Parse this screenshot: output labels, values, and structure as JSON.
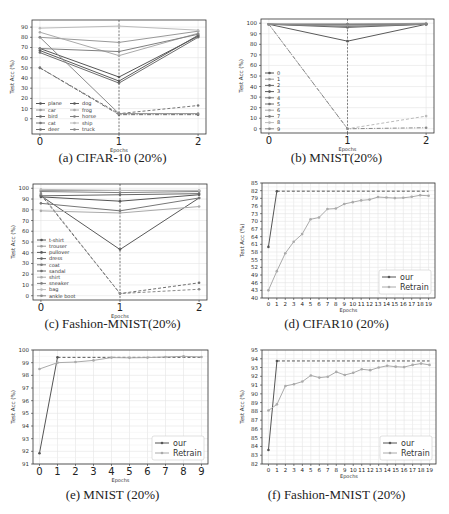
{
  "captions": {
    "a": "(a) CIFAR-10 (20%)",
    "b": "(b) MNIST(20%)",
    "c": "(c) Fashion-MNIST(20%)",
    "d": "(d) CIFAR10 (20%)",
    "e": "(e) MNIST (20%)",
    "f": "(f) Fashion-MNIST (20%)"
  },
  "chart_data": [
    {
      "id": "a",
      "type": "line",
      "title": "(a) CIFAR-10 (20%)",
      "xlabel": "Epochs",
      "ylabel": "Test Acc (%)",
      "x": [
        0,
        1,
        2
      ],
      "ylim": [
        -15,
        97
      ],
      "yticks": [
        0,
        10,
        20,
        30,
        40,
        50,
        60,
        70,
        80,
        90
      ],
      "xticks": [
        0,
        1,
        2
      ],
      "vline": 1,
      "grid": true,
      "legend_position": "lower left",
      "legend_cols": 2,
      "series": [
        {
          "name": "plane",
          "values": [
            69,
            41,
            81
          ],
          "color": "#555555"
        },
        {
          "name": "car",
          "values": [
            80,
            75,
            86
          ],
          "color": "#999999"
        },
        {
          "name": "bird",
          "values": [
            50,
            4,
            4
          ],
          "color": "#666666",
          "dash": "dashdot"
        },
        {
          "name": "cat",
          "values": [
            50,
            5,
            13
          ],
          "color": "#777777",
          "dash": "dashed"
        },
        {
          "name": "deer",
          "values": [
            65,
            35,
            80
          ],
          "color": "#6e6e6e"
        },
        {
          "name": "dog",
          "values": [
            67,
            37,
            82
          ],
          "color": "#5a5a5a"
        },
        {
          "name": "frog",
          "values": [
            85,
            62,
            84
          ],
          "color": "#aaaaaa"
        },
        {
          "name": "horse",
          "values": [
            69,
            66,
            83
          ],
          "color": "#808080"
        },
        {
          "name": "ship",
          "values": [
            89,
            91,
            87
          ],
          "color": "#bbbbbb"
        },
        {
          "name": "truck",
          "values": [
            80,
            5,
            5
          ],
          "color": "#8a8a8a"
        }
      ]
    },
    {
      "id": "b",
      "type": "line",
      "title": "(b) MNIST(20%)",
      "xlabel": "Epochs",
      "ylabel": "Test Acc (%)",
      "x": [
        0,
        1,
        2
      ],
      "ylim": [
        -4,
        104
      ],
      "yticks": [
        0,
        10,
        20,
        30,
        40,
        50,
        60,
        70,
        80,
        90,
        100
      ],
      "xticks": [
        0,
        1,
        2
      ],
      "vline": 1,
      "grid": true,
      "legend_position": "lower left",
      "legend_cols": 1,
      "series": [
        {
          "name": "0",
          "values": [
            99,
            99,
            99
          ],
          "color": "#555555"
        },
        {
          "name": "1",
          "values": [
            99,
            99,
            100
          ],
          "color": "#999999"
        },
        {
          "name": "2",
          "values": [
            99,
            96,
            99
          ],
          "color": "#666666"
        },
        {
          "name": "3",
          "values": [
            99,
            83,
            99
          ],
          "color": "#5a5a5a"
        },
        {
          "name": "4",
          "values": [
            99,
            98,
            99
          ],
          "color": "#777777"
        },
        {
          "name": "5",
          "values": [
            99,
            97,
            99
          ],
          "color": "#6e6e6e"
        },
        {
          "name": "6",
          "values": [
            99,
            98,
            99
          ],
          "color": "#aaaaaa"
        },
        {
          "name": "7",
          "values": [
            99,
            99,
            99
          ],
          "color": "#808080"
        },
        {
          "name": "8",
          "values": [
            99,
            0,
            12
          ],
          "color": "#bbbbbb",
          "dash": "dashed"
        },
        {
          "name": "9",
          "values": [
            99,
            0,
            1
          ],
          "color": "#8a8a8a",
          "dash": "dashdot"
        }
      ]
    },
    {
      "id": "c",
      "type": "line",
      "title": "(c) Fashion-MNIST(20%)",
      "xlabel": "Epochs",
      "ylabel": "Test Acc (%)",
      "x": [
        0,
        1,
        2
      ],
      "ylim": [
        -4,
        104
      ],
      "yticks": [
        0,
        10,
        20,
        30,
        40,
        50,
        60,
        70,
        80,
        90,
        100
      ],
      "xticks": [
        0,
        1,
        2
      ],
      "vline": 1,
      "grid": true,
      "legend_position": "lower left",
      "legend_cols": 1,
      "series": [
        {
          "name": "t-shirt",
          "values": [
            92,
            88,
            94
          ],
          "color": "#555555"
        },
        {
          "name": "trouser",
          "values": [
            98,
            98,
            98
          ],
          "color": "#999999"
        },
        {
          "name": "pullover",
          "values": [
            93,
            43,
            91
          ],
          "color": "#5a5a5a"
        },
        {
          "name": "dress",
          "values": [
            93,
            94,
            95
          ],
          "color": "#666666"
        },
        {
          "name": "coat",
          "values": [
            86,
            79,
            91
          ],
          "color": "#777777"
        },
        {
          "name": "sandal",
          "values": [
            94,
            2,
            12
          ],
          "color": "#6e6e6e",
          "dash": "dashed"
        },
        {
          "name": "shirt",
          "values": [
            79,
            77,
            83
          ],
          "color": "#aaaaaa"
        },
        {
          "name": "sneaker",
          "values": [
            97,
            96,
            97
          ],
          "color": "#808080"
        },
        {
          "name": "bag",
          "values": [
            99,
            98,
            98
          ],
          "color": "#bbbbbb"
        },
        {
          "name": "ankle boot",
          "values": [
            95,
            2,
            6
          ],
          "color": "#8a8a8a",
          "dash": "dashed"
        }
      ]
    },
    {
      "id": "d",
      "type": "line",
      "title": "(d) CIFAR10 (20%)",
      "xlabel": "Epochs",
      "ylabel": "Test Acc (%)",
      "x": [
        0,
        1,
        2,
        3,
        4,
        5,
        6,
        7,
        8,
        9,
        10,
        11,
        12,
        13,
        14,
        15,
        16,
        17,
        18,
        19
      ],
      "ylim": [
        40,
        85
      ],
      "yticks": [
        40,
        43,
        46,
        49,
        52,
        55,
        58,
        61,
        64,
        67,
        70,
        73,
        76,
        79,
        82,
        85
      ],
      "xticks": [
        0,
        1,
        2,
        3,
        4,
        5,
        6,
        7,
        8,
        9,
        10,
        11,
        12,
        13,
        14,
        15,
        16,
        17,
        18,
        19
      ],
      "grid": true,
      "legend_position": "lower right",
      "series": [
        {
          "name": "our",
          "values": [
            60,
            81.8,
            null,
            null,
            null,
            null,
            null,
            null,
            null,
            null,
            null,
            null,
            null,
            null,
            null,
            null,
            null,
            null,
            null,
            null
          ],
          "color": "#555555"
        },
        {
          "name": "Retrain",
          "values": [
            43,
            50.5,
            57.5,
            62,
            65,
            70.8,
            71.5,
            74.8,
            75,
            76.8,
            77.5,
            78.2,
            78.5,
            79.5,
            79.3,
            79.1,
            79.2,
            79.6,
            80.2,
            80
          ],
          "color": "#aaaaaa"
        }
      ],
      "reference_line": {
        "value": 81.8,
        "from": 1,
        "to": 19,
        "style": "dashed",
        "color": "#555555"
      }
    },
    {
      "id": "e",
      "type": "line",
      "title": "(e) MNIST (20%)",
      "xlabel": "Epochs",
      "ylabel": "Test Acc (%)",
      "x": [
        0,
        1,
        2,
        3,
        4,
        5,
        6,
        7,
        8,
        9
      ],
      "ylim": [
        91,
        100
      ],
      "yticks": [
        91,
        92,
        93,
        94,
        95,
        96,
        97,
        98,
        99,
        100
      ],
      "xticks": [
        0,
        1,
        2,
        3,
        4,
        5,
        6,
        7,
        8,
        9
      ],
      "grid": true,
      "legend_position": "lower right",
      "series": [
        {
          "name": "our",
          "values": [
            91.85,
            99.42,
            null,
            null,
            null,
            null,
            null,
            null,
            null,
            null
          ],
          "color": "#555555"
        },
        {
          "name": "Retrain",
          "values": [
            98.5,
            99.0,
            99.05,
            99.18,
            99.4,
            99.38,
            99.4,
            99.45,
            99.5,
            99.45
          ],
          "color": "#aaaaaa"
        }
      ],
      "reference_line": {
        "value": 99.42,
        "from": 1,
        "to": 9,
        "style": "dashed",
        "color": "#555555"
      }
    },
    {
      "id": "f",
      "type": "line",
      "title": "(f) Fashion-MNIST (20%)",
      "xlabel": "Epochs",
      "ylabel": "Test Acc (%)",
      "x": [
        0,
        1,
        2,
        3,
        4,
        5,
        6,
        7,
        8,
        9,
        10,
        11,
        12,
        13,
        14,
        15,
        16,
        17,
        18,
        19
      ],
      "ylim": [
        82,
        95
      ],
      "yticks": [
        82,
        83,
        84,
        85,
        86,
        87,
        88,
        89,
        90,
        91,
        92,
        93,
        94,
        95
      ],
      "xticks": [
        0,
        1,
        2,
        3,
        4,
        5,
        6,
        7,
        8,
        9,
        10,
        11,
        12,
        13,
        14,
        15,
        16,
        17,
        18,
        19
      ],
      "grid": true,
      "legend_position": "lower right",
      "series": [
        {
          "name": "our",
          "values": [
            83.6,
            93.75,
            null,
            null,
            null,
            null,
            null,
            null,
            null,
            null,
            null,
            null,
            null,
            null,
            null,
            null,
            null,
            null,
            null,
            null
          ],
          "color": "#555555"
        },
        {
          "name": "Retrain",
          "values": [
            88.1,
            88.8,
            90.9,
            91.1,
            91.4,
            92.1,
            91.85,
            91.95,
            92.5,
            92.15,
            92.4,
            92.8,
            92.7,
            93.0,
            93.2,
            93.1,
            93.05,
            93.3,
            93.45,
            93.3
          ],
          "color": "#aaaaaa"
        }
      ],
      "reference_line": {
        "value": 93.75,
        "from": 1,
        "to": 19,
        "style": "dashed",
        "color": "#555555"
      }
    }
  ]
}
